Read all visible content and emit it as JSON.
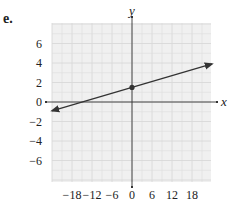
{
  "problem_label": "e.",
  "chart_data": {
    "type": "line",
    "title": "",
    "xlabel": "x",
    "ylabel": "y",
    "xlim": [
      -24,
      24
    ],
    "ylim": [
      -8,
      8
    ],
    "grid": true,
    "x_ticks": [
      -18,
      -12,
      -6,
      0,
      6,
      12,
      18
    ],
    "x_tick_labels": [
      "−18",
      "−12",
      "−6",
      "0",
      "6",
      "12",
      "18"
    ],
    "y_ticks": [
      6,
      4,
      2,
      0,
      -2,
      -4,
      -6
    ],
    "y_tick_labels": [
      "6",
      "4",
      "2",
      "0",
      "−2",
      "−4",
      "−6"
    ],
    "series": [
      {
        "name": "line",
        "x": [
          -24,
          24
        ],
        "y": [
          -0.9,
          3.9
        ],
        "arrows": "both",
        "slope": 0.1,
        "intercept": 1.5
      }
    ],
    "points": [
      {
        "x": 0,
        "y": 1.5,
        "marker": "filled-circle"
      }
    ],
    "colors": {
      "grid": "#d8d8d8",
      "background": "#f0f0f0",
      "axis": "#333333",
      "line": "#333333"
    }
  }
}
